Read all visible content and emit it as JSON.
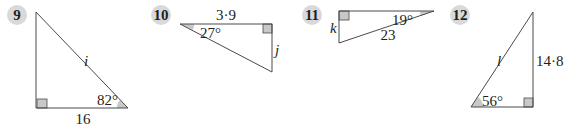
{
  "colors": {
    "line": "#4a4a4a",
    "shade": "#c8c8c8",
    "badge": "#d9d9d9",
    "text": "#231f20"
  },
  "problems": [
    {
      "number": "9",
      "unknown": "i",
      "known_side": "16",
      "angle": "82°"
    },
    {
      "number": "10",
      "unknown": "j",
      "known_side": "3·9",
      "angle": "27°"
    },
    {
      "number": "11",
      "unknown": "k",
      "known_side": "23",
      "angle": "19°"
    },
    {
      "number": "12",
      "unknown": "l",
      "known_side": "14·8",
      "angle": "56°"
    }
  ]
}
